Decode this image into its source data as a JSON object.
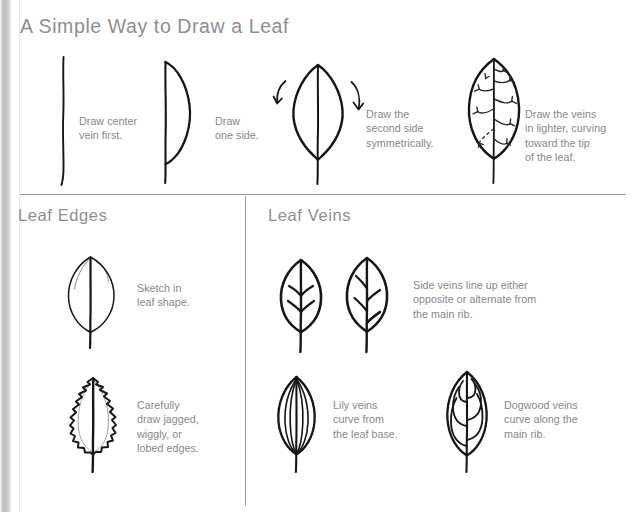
{
  "page": {
    "title": "A Simple Way to Draw a Leaf",
    "width": 637,
    "height": 512,
    "background_color": "#ffffff",
    "heading_color": "#8e8e93",
    "caption_color": "#87878c",
    "ink_color": "#16161a",
    "rule_color": "#9b9b9b"
  },
  "sections": {
    "top": {
      "title": "A Simple Way to Draw a Leaf",
      "steps": [
        {
          "figure": "center-vein-line",
          "caption": "Draw center\nvein first."
        },
        {
          "figure": "half-leaf-outline",
          "caption": "Draw\none side."
        },
        {
          "figure": "full-leaf-outline-with-arrows",
          "caption": "Draw the\nsecond side\nsymmetrically."
        },
        {
          "figure": "leaf-with-veins",
          "caption": "Draw the veins\nin lighter, curving\ntoward the tip\nof the leaf."
        }
      ]
    },
    "edges": {
      "title": "Leaf Edges",
      "items": [
        {
          "figure": "smooth-edge-leaf",
          "caption": "Sketch in\nleaf shape."
        },
        {
          "figure": "jagged-edge-leaf",
          "caption": "Carefully\ndraw jagged,\nwiggly, or\nlobed edges."
        }
      ]
    },
    "veins": {
      "title": "Leaf Veins",
      "items": [
        {
          "figures": [
            "opposite-vein-leaf",
            "alternate-vein-leaf"
          ],
          "caption": "Side veins line up either\nopposite or alternate from\nthe main rib."
        },
        {
          "figures": [
            "lily-vein-leaf"
          ],
          "caption": "Lily veins\ncurve from\nthe leaf base."
        },
        {
          "figures": [
            "dogwood-vein-leaf"
          ],
          "caption": "Dogwood veins\ncurve along the\nmain rib."
        }
      ]
    }
  }
}
